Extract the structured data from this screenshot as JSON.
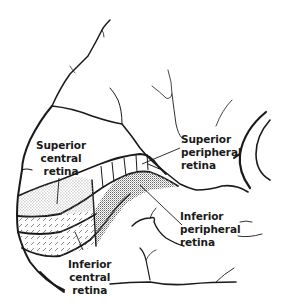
{
  "diagram": {
    "type": "anatomical-line-drawing",
    "colors": {
      "ink": "#1a1a1a",
      "background": "#ffffff",
      "stipple": "#6b6b6b"
    },
    "regions": [
      {
        "id": "superior-central",
        "pattern": "fine-dots"
      },
      {
        "id": "superior-peripheral",
        "pattern": "vertical-lines"
      },
      {
        "id": "inferior-peripheral",
        "pattern": "dense-dots"
      },
      {
        "id": "inferior-central",
        "pattern": "diagonal-dashes"
      }
    ]
  },
  "labels": {
    "superior_central": {
      "line1": "Superior",
      "line2": "central",
      "line3": "retina"
    },
    "superior_peripheral": {
      "line1": "Superior",
      "line2": "peripheral",
      "line3": "retina"
    },
    "inferior_peripheral": {
      "line1": "Inferior",
      "line2": "peripheral",
      "line3": "retina"
    },
    "inferior_central": {
      "line1": "Inferior",
      "line2": "central",
      "line3": "retina"
    }
  }
}
